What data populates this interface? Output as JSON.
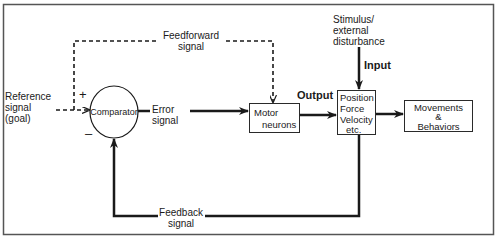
{
  "diagram": {
    "type": "feedback-control-loop",
    "labels": {
      "reference_signal": [
        "Reference",
        "signal",
        "(goal)"
      ],
      "plus": "+",
      "minus": "–",
      "comparator": "Comparator",
      "error_signal": [
        "Error",
        "signal"
      ],
      "feedforward_signal": [
        "Feedforward",
        "signal"
      ],
      "motor_neurons": [
        "Motor",
        "neurons"
      ],
      "output": "Output",
      "stimulus": [
        "Stimulus/",
        "external",
        "disturbance"
      ],
      "input": "Input",
      "plant_box": [
        "Position",
        "Force",
        "Velocity",
        "etc."
      ],
      "movements_box": [
        "Movements",
        "&",
        "Behaviors"
      ],
      "feedback_signal": [
        "Feedback",
        "signal"
      ]
    },
    "nodes": [
      {
        "id": "reference",
        "label": "Reference signal (goal)",
        "shape": "text"
      },
      {
        "id": "comparator",
        "label": "Comparator",
        "shape": "ellipse"
      },
      {
        "id": "motor_neurons",
        "label": "Motor neurons",
        "shape": "rect"
      },
      {
        "id": "plant",
        "label": "Position Force Velocity etc.",
        "shape": "rect"
      },
      {
        "id": "movements",
        "label": "Movements & Behaviors",
        "shape": "rect"
      },
      {
        "id": "stimulus",
        "label": "Stimulus/ external disturbance",
        "shape": "text"
      }
    ],
    "edges": [
      {
        "from": "reference",
        "to": "comparator",
        "style": "dashed",
        "sign": "+"
      },
      {
        "from": "reference",
        "to": "motor_neurons",
        "label": "Feedforward signal",
        "style": "dashed"
      },
      {
        "from": "comparator",
        "to": "motor_neurons",
        "label": "Error signal",
        "style": "solid"
      },
      {
        "from": "motor_neurons",
        "to": "plant",
        "label": "Output",
        "style": "solid"
      },
      {
        "from": "stimulus",
        "to": "plant",
        "label": "Input",
        "style": "solid"
      },
      {
        "from": "plant",
        "to": "movements",
        "style": "solid"
      },
      {
        "from": "plant",
        "to": "comparator",
        "label": "Feedback signal",
        "style": "solid",
        "sign": "-"
      }
    ],
    "colors": {
      "line": "#1a1a1a",
      "frame": "#555555",
      "background": "#ffffff"
    }
  }
}
